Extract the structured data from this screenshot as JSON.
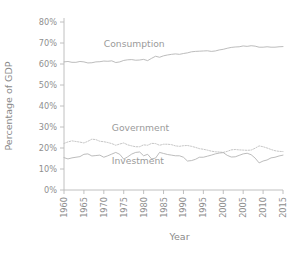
{
  "chart_data": {
    "type": "line",
    "title": "",
    "xlabel": "Year",
    "ylabel": "Percentage of GDP",
    "xlim": [
      1960,
      2015
    ],
    "ylim": [
      0,
      80
    ],
    "grid": false,
    "legend_position": "inline-annotations",
    "x_ticks": [
      "1960",
      "1965",
      "1970",
      "1975",
      "1980",
      "1985",
      "1990",
      "1995",
      "2000",
      "2005",
      "2010",
      "2015"
    ],
    "y_ticks": [
      "0%",
      "10%",
      "20%",
      "30%",
      "40%",
      "50%",
      "60%",
      "70%",
      "80%"
    ],
    "x_tick_values": [
      1960,
      1965,
      1970,
      1975,
      1980,
      1985,
      1990,
      1995,
      2000,
      2005,
      2010,
      2015
    ],
    "y_tick_values": [
      0,
      10,
      20,
      30,
      40,
      50,
      60,
      70,
      80
    ],
    "x": [
      1960,
      1961,
      1962,
      1963,
      1964,
      1965,
      1966,
      1967,
      1968,
      1969,
      1970,
      1971,
      1972,
      1973,
      1974,
      1975,
      1976,
      1977,
      1978,
      1979,
      1980,
      1981,
      1982,
      1983,
      1984,
      1985,
      1986,
      1987,
      1988,
      1989,
      1990,
      1991,
      1992,
      1993,
      1994,
      1995,
      1996,
      1997,
      1998,
      1999,
      2000,
      2001,
      2002,
      2003,
      2004,
      2005,
      2006,
      2007,
      2008,
      2009,
      2010,
      2011,
      2012,
      2013,
      2014,
      2015
    ],
    "series": [
      {
        "name": "Consumption",
        "color": "#b0b0b0",
        "style": "solid",
        "label_x": 1970,
        "label_y": 68,
        "values": [
          61.0,
          61.2,
          60.8,
          60.8,
          61.2,
          61.0,
          60.5,
          60.6,
          61.0,
          61.1,
          61.4,
          61.3,
          61.5,
          60.7,
          61.0,
          61.7,
          62.0,
          62.1,
          61.8,
          61.9,
          62.2,
          61.6,
          62.7,
          63.7,
          63.2,
          63.9,
          64.3,
          64.6,
          64.8,
          64.6,
          65.0,
          65.3,
          65.8,
          66.0,
          66.1,
          66.2,
          66.3,
          66.0,
          66.2,
          66.7,
          67.0,
          67.5,
          67.9,
          68.1,
          68.2,
          68.6,
          68.4,
          68.7,
          68.5,
          68.0,
          68.0,
          68.2,
          68.0,
          68.0,
          68.2,
          68.3
        ]
      },
      {
        "name": "Government",
        "color": "#bcbcbc",
        "style": "dotted",
        "label_x": 1972,
        "label_y": 28,
        "values": [
          22.2,
          22.9,
          23.4,
          23.1,
          22.8,
          22.4,
          23.2,
          24.2,
          24.0,
          23.2,
          23.0,
          22.6,
          22.1,
          21.3,
          21.9,
          22.4,
          21.5,
          21.0,
          20.6,
          20.6,
          21.5,
          21.3,
          22.2,
          22.1,
          21.3,
          21.8,
          21.8,
          21.6,
          21.0,
          20.8,
          21.1,
          21.2,
          20.8,
          20.3,
          19.7,
          19.4,
          19.0,
          18.5,
          18.2,
          18.1,
          17.9,
          18.4,
          19.1,
          19.3,
          19.1,
          19.0,
          18.9,
          19.0,
          19.9,
          21.0,
          20.6,
          20.0,
          19.3,
          18.7,
          18.4,
          18.3
        ]
      },
      {
        "name": "Investment",
        "color": "#b0b0b0",
        "style": "solid",
        "label_x": 1972,
        "label_y": 12.5,
        "values": [
          15.4,
          14.8,
          15.3,
          15.6,
          15.9,
          17.0,
          17.2,
          16.2,
          16.4,
          16.6,
          15.6,
          16.3,
          17.1,
          17.9,
          17.0,
          14.7,
          15.8,
          17.1,
          17.9,
          18.1,
          16.3,
          17.0,
          14.8,
          15.2,
          17.9,
          17.4,
          16.9,
          16.6,
          16.3,
          16.3,
          15.6,
          13.8,
          14.0,
          14.6,
          15.6,
          15.6,
          16.1,
          16.6,
          17.2,
          17.6,
          17.8,
          16.5,
          15.7,
          15.8,
          16.5,
          17.2,
          17.5,
          16.8,
          15.2,
          12.9,
          13.8,
          14.3,
          15.3,
          15.6,
          16.2,
          16.6
        ]
      }
    ]
  }
}
